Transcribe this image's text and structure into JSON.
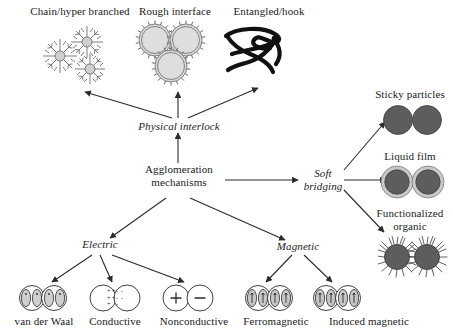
{
  "figure": {
    "type": "flow-diagram",
    "title": "Agglomeration mechanisms",
    "background": "#ffffff",
    "line_color": "#2b2b2b"
  },
  "nodes": {
    "root": {
      "label": "Agglomeration\nmechanisms",
      "style": "upright"
    },
    "physical_interlock": {
      "label": "Physical interlock",
      "style": "italic"
    },
    "soft_bridging": {
      "label": "Soft\nbridging",
      "style": "italic"
    },
    "electric": {
      "label": "Electric",
      "style": "italic"
    },
    "magnetic": {
      "label": "Magnetic",
      "style": "italic"
    }
  },
  "leaves": {
    "chain": {
      "label": "Chain/hyper branched",
      "icon": "dendrite-cluster-icon"
    },
    "rough": {
      "label": "Rough interface",
      "icon": "gear-particles-icon"
    },
    "entangled": {
      "label": "Entangled/hook",
      "icon": "tangled-fiber-icon"
    },
    "sticky": {
      "label": "Sticky particles",
      "icon": "two-dark-spheres-icon"
    },
    "liquid": {
      "label": "Liquid film",
      "icon": "spheres-with-film-icon"
    },
    "organic": {
      "label": "Functionalized\norganic",
      "icon": "hairy-spheres-icon"
    },
    "vanderwaal": {
      "label": "van der Waal",
      "icon": "dipole-pair-icon"
    },
    "conductive": {
      "label": "Conductive",
      "icon": "charge-transfer-spheres-icon"
    },
    "nonconductive": {
      "label": "Nonconductive",
      "icon": "plus-minus-spheres-icon"
    },
    "ferromagnetic": {
      "label": "Ferromagnetic",
      "icon": "magnetic-dipole-pair-icon"
    },
    "induced": {
      "label": "Induced magnetic",
      "icon": "magnetic-dipole-pair-icon"
    }
  },
  "icon_marks": {
    "plus": "+",
    "minus": "-"
  },
  "colors": {
    "dark_particle": "#5d5d5d",
    "light_particle": "#d6d6d6",
    "film_ring": "#c9c9c9",
    "outline": "#2b2b2b"
  }
}
